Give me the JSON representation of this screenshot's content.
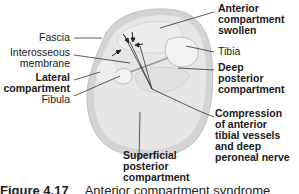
{
  "labels": {
    "fascia": "Fascia",
    "interosseous_1": "Interosseous",
    "interosseous_2": "membrane",
    "lateral_1": "Lateral",
    "lateral_2": "compartment",
    "fibula": "Fibula",
    "anterior_1": "Anterior",
    "anterior_2": "compartment",
    "anterior_3": "swollen",
    "tibia": "Tibia",
    "deep_1": "Deep",
    "deep_2": "posterior",
    "deep_3": "compartment",
    "compression_1": "Compression",
    "compression_2": "of anterior",
    "compression_3": "tibial vessels",
    "compression_4": "and deep",
    "compression_5": "peroneal nerve",
    "superficial_1": "Superficial",
    "superficial_2": "posterior",
    "superficial_3": "compartment"
  },
  "caption": {
    "number": "Figure 4.17",
    "title": "Anterior compartment syndrome"
  },
  "colors": {
    "outer_ring": "#d6d6d6",
    "tissue": "#e4e4e4",
    "bone": "#f0f0f0",
    "line": "#222222"
  }
}
